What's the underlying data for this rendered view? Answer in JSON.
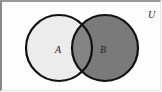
{
  "diagram": {
    "type": "venn",
    "universe_label": "U",
    "sets": [
      {
        "label": "A",
        "fill": "#ececec",
        "shaded": false
      },
      {
        "label": "B",
        "fill": "#7a7a7a",
        "shaded": true
      }
    ],
    "intersection_fill": "#848484",
    "outline_color": "#111111",
    "shaded_region": "B"
  }
}
